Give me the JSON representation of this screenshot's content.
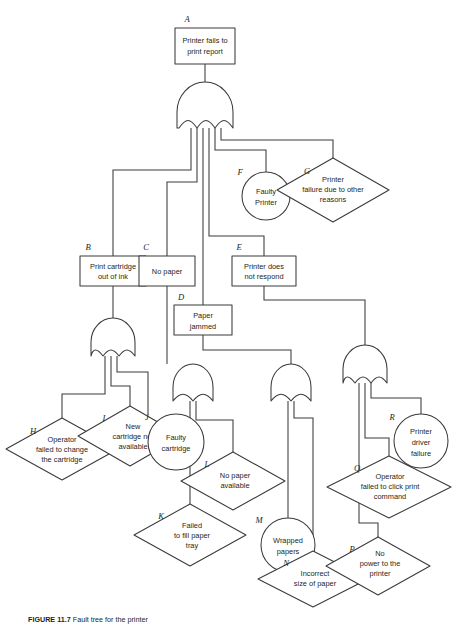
{
  "figure": {
    "caption_prefix": "FIGURE 11.7",
    "caption_text": "Fault tree for the printer"
  },
  "nodes": {
    "A": {
      "id": "A",
      "label": "Printer fails to print report",
      "line1": "Printer fails to",
      "line2": "print report",
      "shape": "rectangle",
      "type": "top-event"
    },
    "B": {
      "id": "B",
      "label": "Print cartridge out of ink",
      "line1": "Print cartridge",
      "line2": "out of ink",
      "shape": "rectangle",
      "type": "intermediate-event"
    },
    "C": {
      "id": "C",
      "label": "No paper",
      "line1": "No paper",
      "line2": "",
      "shape": "rectangle",
      "type": "intermediate-event"
    },
    "D": {
      "id": "D",
      "label": "Paper jammed",
      "line1": "Paper",
      "line2": "jammed",
      "shape": "rectangle",
      "type": "intermediate-event"
    },
    "E": {
      "id": "E",
      "label": "Printer does not respond",
      "line1": "Printer does",
      "line2": "not respond",
      "shape": "rectangle",
      "type": "intermediate-event"
    },
    "F": {
      "id": "F",
      "label": "Faulty Printer",
      "line1": "Faulty",
      "line2": "Printer",
      "shape": "circle",
      "type": "basic-event"
    },
    "G": {
      "id": "G",
      "label": "Printer failure due to other reasons",
      "line1": "Printer",
      "line2": "failure due to other",
      "line3": "reasons",
      "shape": "diamond",
      "type": "undeveloped-event"
    },
    "H": {
      "id": "H",
      "label": "Operator failed to change the cartridge",
      "line1": "Operator",
      "line2": "failed to change",
      "line3": "the cartridge",
      "shape": "diamond",
      "type": "undeveloped-event"
    },
    "I": {
      "id": "I",
      "label": "New cartridge not available",
      "line1": "New",
      "line2": "cartridge not",
      "line3": "available",
      "shape": "diamond",
      "type": "undeveloped-event"
    },
    "J": {
      "id": "J",
      "label": "Faulty cartridge",
      "line1": "Faulty",
      "line2": "cartridge",
      "shape": "circle",
      "type": "basic-event"
    },
    "K": {
      "id": "K",
      "label": "Failed to fill paper tray",
      "line1": "Failed",
      "line2": "to fill paper",
      "line3": "tray",
      "shape": "diamond",
      "type": "undeveloped-event"
    },
    "L": {
      "id": "L",
      "label": "No paper available",
      "line1": "No paper",
      "line2": "available",
      "line3": "",
      "shape": "diamond",
      "type": "undeveloped-event"
    },
    "M": {
      "id": "M",
      "label": "Wrapped papers",
      "line1": "Wrapped",
      "line2": "papers",
      "shape": "circle",
      "type": "basic-event"
    },
    "N": {
      "id": "N",
      "label": "Incorrect size of paper",
      "line1": "Incorrect",
      "line2": "size of paper",
      "line3": "",
      "shape": "diamond",
      "type": "undeveloped-event"
    },
    "P": {
      "id": "P",
      "label": "No power to the printer",
      "line1": "No",
      "line2": "power to the",
      "line3": "printer",
      "shape": "diamond",
      "type": "undeveloped-event"
    },
    "Q": {
      "id": "Q",
      "label": "Operator failed to click print command",
      "line1": "Operator",
      "line2": "failed to click print",
      "line3": "command",
      "shape": "diamond",
      "type": "undeveloped-event"
    },
    "R": {
      "id": "R",
      "label": "Printer driver failure",
      "line1": "Printer",
      "line2": "driver",
      "line3": "failure",
      "shape": "circle",
      "type": "basic-event"
    }
  },
  "gates": [
    {
      "name": "gate-top",
      "type": "OR",
      "output": "A",
      "inputs": [
        "B",
        "C",
        "D",
        "E",
        "F",
        "G"
      ]
    },
    {
      "name": "gate-cartridge",
      "type": "OR",
      "output": "B",
      "inputs": [
        "H",
        "I",
        "J"
      ]
    },
    {
      "name": "gate-paper",
      "type": "OR",
      "output": "C",
      "inputs": [
        "K",
        "L"
      ]
    },
    {
      "name": "gate-jam",
      "type": "OR",
      "output": "D",
      "inputs": [
        "M",
        "N"
      ]
    },
    {
      "name": "gate-respond",
      "type": "OR",
      "output": "E",
      "inputs": [
        "P",
        "Q",
        "R"
      ]
    }
  ],
  "colors": {
    "stroke": "#3a3a3c",
    "text": "#231f20",
    "background": "#ffffff"
  }
}
